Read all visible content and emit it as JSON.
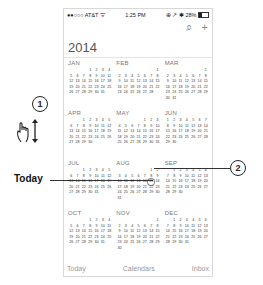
{
  "status_bar": {
    "carrier": "●●○○○ AT&T ᯤ",
    "time": "1:25 PM",
    "right": "⊕ ↗ ✱ 28%"
  },
  "toolbar": {
    "search_icon": "⌕",
    "add_icon": "+"
  },
  "year": "2014",
  "months": [
    {
      "name": "JAN",
      "offset": 3,
      "days": 31
    },
    {
      "name": "FEB",
      "offset": 6,
      "days": 28
    },
    {
      "name": "MAR",
      "offset": 6,
      "days": 31
    },
    {
      "name": "APR",
      "offset": 2,
      "days": 30
    },
    {
      "name": "MAY",
      "offset": 4,
      "days": 31
    },
    {
      "name": "JUN",
      "offset": 0,
      "days": 30
    },
    {
      "name": "JUL",
      "offset": 2,
      "days": 31
    },
    {
      "name": "AUG",
      "offset": 5,
      "days": 31
    },
    {
      "name": "SEP",
      "offset": 1,
      "days": 30
    },
    {
      "name": "OCT",
      "offset": 3,
      "days": 31
    },
    {
      "name": "NOV",
      "offset": 6,
      "days": 30
    },
    {
      "name": "DEC",
      "offset": 1,
      "days": 31
    }
  ],
  "today": {
    "month": "AUG",
    "day": 15
  },
  "tab_bar": {
    "today": "Today",
    "calendars": "Calendars",
    "inbox": "Inbox"
  },
  "annotations": {
    "callout_1": "1",
    "callout_2": "2",
    "today_label": "Today"
  }
}
